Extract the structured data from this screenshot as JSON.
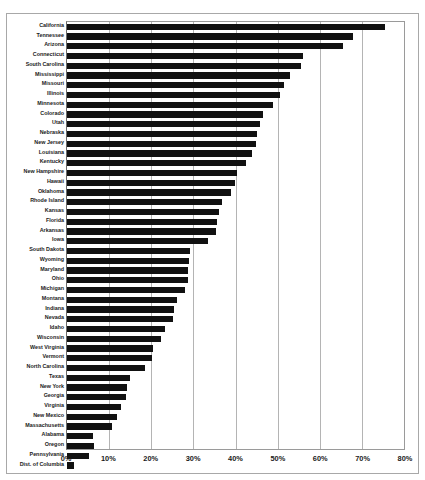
{
  "chart_title_partial": "",
  "axis": {
    "x_ticks": [
      "0%",
      "10%",
      "20%",
      "30%",
      "40%",
      "50%",
      "60%",
      "70%",
      "80%"
    ],
    "x_tick_values": [
      0,
      10,
      20,
      30,
      40,
      50,
      60,
      70,
      80
    ]
  },
  "colors": {
    "bar": "#111111",
    "gridline": "#b4b4b4",
    "frame": "#a8a8a8",
    "text": "#1a1a1a",
    "background": "#ffffff"
  },
  "chart_data": {
    "type": "bar",
    "orientation": "horizontal",
    "title": "",
    "xlabel": "",
    "ylabel": "",
    "xlim": [
      0,
      80
    ],
    "grid": true,
    "legend": "none",
    "unit": "%",
    "categories": [
      "California",
      "Tennessee",
      "Arizona",
      "Connecticut",
      "South Carolina",
      "Mississippi",
      "Missouri",
      "Illinois",
      "Minnesota",
      "Colorado",
      "Utah",
      "Nebraska",
      "New Jersey",
      "Louisiana",
      "Kentucky",
      "New Hampshire",
      "Hawaii",
      "Oklahoma",
      "Rhode Island",
      "Kansas",
      "Florida",
      "Arkansas",
      "Iowa",
      "South Dakota",
      "Wyoming",
      "Maryland",
      "Ohio",
      "Michigan",
      "Montana",
      "Indiana",
      "Nevada",
      "Idaho",
      "Wisconsin",
      "West Virginia",
      "Vermont",
      "North Carolina",
      "Texas",
      "New York",
      "Georgia",
      "Virginia",
      "New Mexico",
      "Massachusetts",
      "Alabama",
      "Oregon",
      "Pennsylvania",
      "Dist. of Columbia"
    ],
    "values": [
      75.5,
      68.0,
      65.5,
      56.0,
      55.5,
      53.0,
      51.5,
      50.5,
      49.0,
      46.5,
      45.8,
      45.0,
      44.8,
      43.8,
      42.4,
      40.3,
      39.8,
      39.0,
      36.8,
      36.2,
      35.7,
      35.4,
      33.4,
      29.3,
      29.0,
      28.8,
      28.7,
      27.9,
      26.2,
      25.5,
      25.2,
      23.2,
      22.2,
      20.5,
      20.2,
      18.6,
      15.0,
      14.2,
      14.0,
      12.8,
      11.8,
      10.6,
      6.1,
      6.3,
      5.2,
      1.6
    ]
  }
}
